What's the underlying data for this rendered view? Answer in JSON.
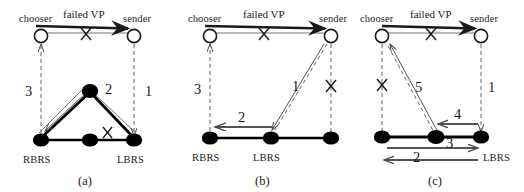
{
  "figure": {
    "type": "diagram",
    "panels": [
      {
        "id": "a",
        "caption": "(a)",
        "nodes": [
          {
            "name": "chooser",
            "label": "chooser",
            "style": "hollow-circle"
          },
          {
            "name": "sender",
            "label": "sender",
            "style": "hollow-circle"
          },
          {
            "name": "rbrs",
            "label": "RBRS",
            "style": "filled-ellipse"
          },
          {
            "name": "apex",
            "label": "",
            "style": "filled-ellipse"
          },
          {
            "name": "lbrs",
            "label": "LBRS",
            "style": "filled-ellipse"
          }
        ],
        "edge_label": "failed VP",
        "crosses": [
          "X",
          "X"
        ],
        "step_labels": [
          "3",
          "2",
          "1"
        ]
      },
      {
        "id": "b",
        "caption": "(b)",
        "nodes": [
          {
            "name": "chooser",
            "label": "chooser",
            "style": "hollow-circle"
          },
          {
            "name": "sender",
            "label": "sender",
            "style": "hollow-circle"
          },
          {
            "name": "rbrs",
            "label": "RBRS",
            "style": "filled-ellipse"
          },
          {
            "name": "lbrs",
            "label": "LBRS",
            "style": "filled-ellipse"
          },
          {
            "name": "right",
            "label": "",
            "style": "filled-ellipse"
          }
        ],
        "edge_label": "failed VP",
        "crosses": [
          "X",
          "X"
        ],
        "step_labels": [
          "3",
          "2",
          "1"
        ]
      },
      {
        "id": "c",
        "caption": "(c)",
        "nodes": [
          {
            "name": "chooser",
            "label": "chooser",
            "style": "hollow-circle"
          },
          {
            "name": "sender",
            "label": "sender",
            "style": "hollow-circle"
          },
          {
            "name": "left",
            "label": "",
            "style": "filled-ellipse"
          },
          {
            "name": "middle",
            "label": "",
            "style": "filled-ellipse"
          },
          {
            "name": "lbrs",
            "label": "LBRS",
            "style": "filled-ellipse"
          }
        ],
        "edge_label": "failed VP",
        "crosses": [
          "X",
          "X"
        ],
        "step_labels": [
          "5",
          "4",
          "3",
          "2",
          "1"
        ]
      }
    ]
  },
  "panel_a": {
    "chooser": "chooser",
    "sender": "sender",
    "failed_vp": "failed VP",
    "x_top": "X",
    "x_bottom": "X",
    "n3": "3",
    "n2": "2",
    "n1": "1",
    "rbrs": "RBRS",
    "lbrs": "LBRS",
    "caption": "(a)"
  },
  "panel_b": {
    "chooser": "chooser",
    "sender": "sender",
    "failed_vp": "failed VP",
    "x_top": "X",
    "x_right": "X",
    "n3": "3",
    "n2": "2",
    "n1": "1",
    "rbrs": "RBRS",
    "lbrs": "LBRS",
    "caption": "(b)"
  },
  "panel_c": {
    "chooser": "chooser",
    "sender": "sender",
    "failed_vp": "failed VP",
    "x_top": "X",
    "x_left": "X",
    "n5": "5",
    "n4": "4",
    "n3": "3",
    "n2": "2",
    "n1": "1",
    "lbrs": "LBRS",
    "caption": "(c)"
  },
  "colors": {
    "stroke": "#1a1a1a",
    "node_fill": "#000000",
    "node_hollow": "#ffffff",
    "background": "#ffffff",
    "thin_stroke": "#555555"
  }
}
